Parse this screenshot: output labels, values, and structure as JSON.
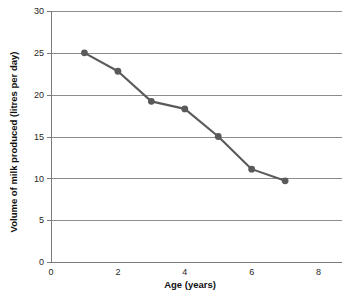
{
  "chart_data": {
    "type": "line",
    "title": "",
    "xlabel": "Age (years)",
    "ylabel": "Volume of milk produced (litres per day)",
    "xlim": [
      0,
      8.7
    ],
    "ylim": [
      0,
      30
    ],
    "xticks": [
      0,
      2,
      4,
      6,
      8
    ],
    "xtick_labels": [
      "0",
      "2",
      "4",
      "6",
      "8"
    ],
    "yticks": [
      0,
      5,
      10,
      15,
      20,
      25,
      30
    ],
    "ytick_labels": [
      "0",
      "5",
      "10",
      "15",
      "20",
      "25",
      "30"
    ],
    "grid": "horizontal",
    "legend": "none",
    "series": [
      {
        "name": "Milk production by age",
        "color": "#5a5a5a",
        "marker": "circle",
        "x": [
          1,
          2,
          3,
          4,
          5,
          6,
          7
        ],
        "values": [
          25.0,
          22.8,
          19.2,
          18.3,
          15.0,
          11.1,
          9.7
        ]
      }
    ]
  },
  "style": {
    "background": "#ffffff",
    "grid_color": "#8c8c8c",
    "axis_color": "#7a7a7a",
    "text_color": "#262626",
    "series_color": "#5a5a5a",
    "line_width": 2.1,
    "marker_radius": 3.4
  },
  "geometry": {
    "plot_left": 51,
    "plot_right": 342,
    "plot_top": 11,
    "plot_bottom": 262,
    "x_per_unit": 33.6,
    "y_per_unit": 8.366
  }
}
